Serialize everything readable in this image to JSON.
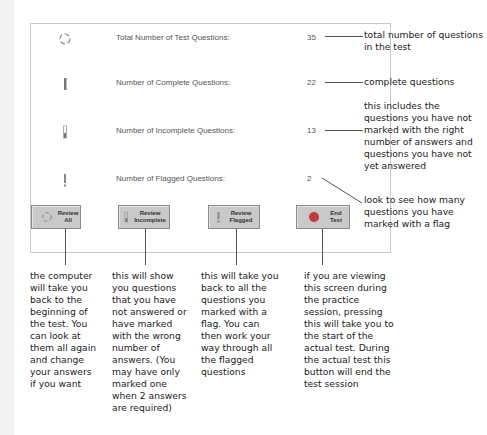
{
  "summary": {
    "rows": [
      {
        "icon": "refresh-circle-icon",
        "label": "Total Number of Test Questions:",
        "value": "35"
      },
      {
        "icon": "complete-bar-icon",
        "label": "Number of Complete Questions:",
        "value": "22"
      },
      {
        "icon": "incomplete-bar-icon",
        "label": "Number of Incomplete Questions:",
        "value": "13"
      },
      {
        "icon": "flag-exclamation-icon",
        "label": "Number of Flagged Questions:",
        "value": "2"
      }
    ]
  },
  "buttons": [
    {
      "label": "Review\nAll",
      "icon": "refresh-circle-icon"
    },
    {
      "label": "Review\nIncomplete",
      "icon": "incomplete-bar-icon"
    },
    {
      "label": "Review\nFlagged",
      "icon": "flag-exclamation-icon"
    },
    {
      "label": "End\nTest",
      "icon": "red-dot-icon"
    }
  ],
  "callouts": {
    "total": "total number of questions in the test",
    "complete": "complete questions",
    "incomplete": "this includes the questions you have not marked with the right number of answers and questions you have not yet answered",
    "flagged": "look to see how many questions you have marked with a flag"
  },
  "descriptions": [
    "the computer will take you back to the beginning of the test. You can look at them all again and change your answers if you want",
    "this will show you questions that you have not answered or have marked with the wrong number of answers. (You may have only marked one when 2 answers are required)",
    "this will take you back to all the questions you marked with a flag. You can then work your way through all the flagged questions",
    "if you are viewing this screen during the practice session, pressing this will take you to the start of the actual test. During the actual test this button will end the test session"
  ],
  "colors": {
    "button_bg": "#c9c9c9",
    "end_dot": "#c0393b",
    "panel_border": "#c8c8c8"
  }
}
